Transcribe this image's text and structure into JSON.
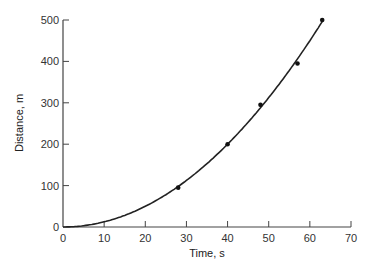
{
  "chart_data": {
    "type": "scatter",
    "title": "",
    "xlabel": "Time, s",
    "ylabel": "Distance, m",
    "xlim": [
      0,
      70
    ],
    "ylim": [
      0,
      500
    ],
    "x_ticks": [
      0,
      10,
      20,
      30,
      40,
      50,
      60,
      70
    ],
    "y_ticks": [
      0,
      100,
      200,
      300,
      400,
      500
    ],
    "grid": false,
    "legend": null,
    "series": [
      {
        "name": "measured",
        "kind": "scatter",
        "x": [
          28,
          40,
          48,
          57,
          63
        ],
        "y": [
          95,
          200,
          295,
          395,
          500
        ]
      },
      {
        "name": "fitted curve",
        "kind": "line",
        "equation": "d = 0.125 t^2",
        "x": [
          0,
          10,
          20,
          30,
          40,
          50,
          60,
          63
        ],
        "y": [
          0,
          12.5,
          50,
          112.5,
          200,
          312.5,
          450,
          496
        ]
      }
    ]
  },
  "colors": {
    "axis": "#444444",
    "curve": "#222222",
    "points": "#111111",
    "background": "#ffffff"
  }
}
